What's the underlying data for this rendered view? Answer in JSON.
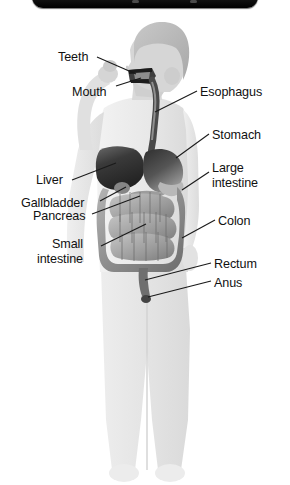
{
  "window": {
    "top_bar": {
      "name": "toolbar-strip",
      "color": "#111111"
    }
  },
  "diagram": {
    "colors": {
      "background": "#ffffff",
      "body_fill": "#e9e9e9",
      "body_shade": "#d8d8d8",
      "hair": "#b9b9b9",
      "skin": "#d2d2d2",
      "organ_dark": "#3b3b3b",
      "organ_mid": "#7d7d7d",
      "organ_light": "#c2c2c2",
      "leader_line": "#1a1a1a",
      "label_text": "#111111"
    },
    "labels": [
      {
        "id": "teeth",
        "text": "Teeth",
        "side": "left",
        "x": 58,
        "y": 50,
        "lines": [
          "Teeth"
        ]
      },
      {
        "id": "mouth",
        "text": "Mouth",
        "side": "left",
        "x": 72,
        "y": 85,
        "lines": [
          "Mouth"
        ]
      },
      {
        "id": "esophagus",
        "text": "Esophagus",
        "side": "right",
        "x": 200,
        "y": 85,
        "lines": [
          "Esophagus"
        ]
      },
      {
        "id": "stomach",
        "text": "Stomach",
        "side": "right",
        "x": 212,
        "y": 128,
        "lines": [
          "Stomach"
        ]
      },
      {
        "id": "large-intestine",
        "text": "Large intestine",
        "side": "right",
        "x": 212,
        "y": 161,
        "lines": [
          "Large",
          "intestine"
        ]
      },
      {
        "id": "liver",
        "text": "Liver",
        "side": "left",
        "x": 36,
        "y": 173,
        "lines": [
          "Liver"
        ]
      },
      {
        "id": "gallbladder",
        "text": "Gallbladder",
        "side": "left",
        "x": 21,
        "y": 196,
        "lines": [
          "Gallbladder"
        ]
      },
      {
        "id": "pancreas",
        "text": "Pancreas",
        "side": "left",
        "x": 33,
        "y": 209,
        "lines": [
          "Pancreas"
        ]
      },
      {
        "id": "colon",
        "text": "Colon",
        "side": "right",
        "x": 218,
        "y": 214,
        "lines": [
          "Colon"
        ]
      },
      {
        "id": "small-intestine",
        "text": "Small intestine",
        "side": "left",
        "x": 37,
        "y": 237,
        "lines": [
          "Small",
          "intestine"
        ]
      },
      {
        "id": "rectum",
        "text": "Rectum",
        "side": "right",
        "x": 214,
        "y": 257,
        "lines": [
          "Rectum"
        ]
      },
      {
        "id": "anus",
        "text": "Anus",
        "side": "right",
        "x": 214,
        "y": 276,
        "lines": [
          "Anus"
        ]
      }
    ],
    "organs": [
      {
        "id": "mouth-cavity",
        "name": "mouth-cavity"
      },
      {
        "id": "esophagus-tube",
        "name": "esophagus-tube"
      },
      {
        "id": "liver-organ",
        "name": "liver-organ"
      },
      {
        "id": "stomach-organ",
        "name": "stomach-organ"
      },
      {
        "id": "gallbladder-organ",
        "name": "gallbladder-organ"
      },
      {
        "id": "pancreas-organ",
        "name": "pancreas-organ"
      },
      {
        "id": "large-intestine-organ",
        "name": "large-intestine-organ"
      },
      {
        "id": "small-intestine-organ",
        "name": "small-intestine-organ"
      },
      {
        "id": "rectum-organ",
        "name": "rectum-organ"
      }
    ]
  }
}
